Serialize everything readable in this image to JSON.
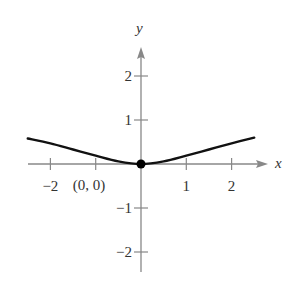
{
  "chart_data": {
    "type": "line",
    "title": "",
    "xlabel": "x",
    "ylabel": "y",
    "xlim": [
      -2.5,
      2.8
    ],
    "ylim": [
      -2.5,
      2.7
    ],
    "x_ticks": [
      -2,
      -1,
      1,
      2
    ],
    "x_tick_labels": [
      "−2",
      "",
      "1",
      "2"
    ],
    "y_ticks": [
      -2,
      -1,
      1,
      2
    ],
    "y_tick_labels": [
      "−2",
      "−1",
      "1",
      "2"
    ],
    "grid": false,
    "series": [
      {
        "name": "curve",
        "x": [
          -2.5,
          -2,
          -1.5,
          -1,
          -0.5,
          0,
          0.5,
          1,
          1.5,
          2,
          2.5
        ],
        "y": [
          0.58,
          0.47,
          0.33,
          0.19,
          0.06,
          0,
          0.06,
          0.19,
          0.33,
          0.47,
          0.6
        ]
      }
    ],
    "annotations": [
      {
        "text": "(0, 0)",
        "x": 0,
        "y": 0,
        "point": true
      }
    ]
  },
  "labels": {
    "x_axis": "x",
    "y_axis": "y",
    "point_label": "(0, 0)"
  },
  "colors": {
    "axis": "#888888",
    "curve": "#111111",
    "text": "#333333"
  }
}
